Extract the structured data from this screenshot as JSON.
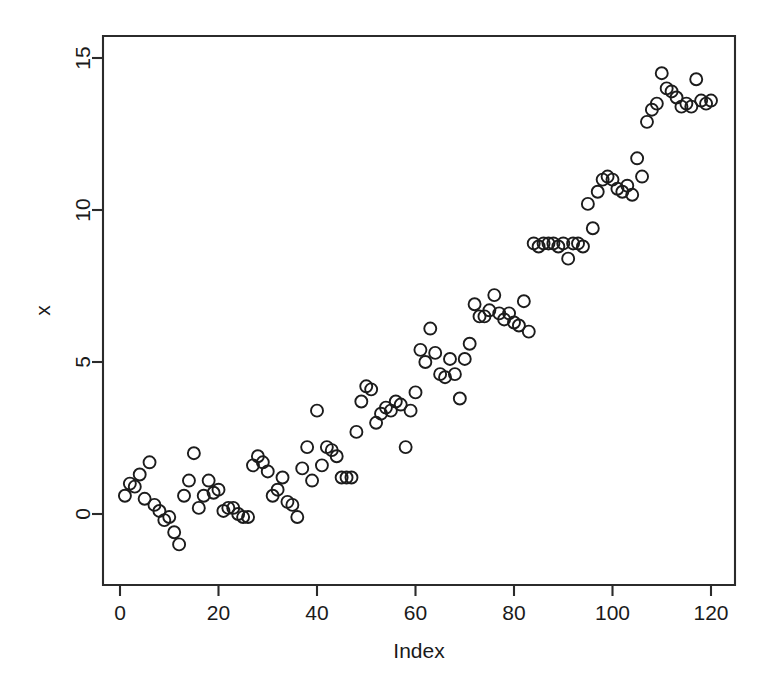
{
  "figure": {
    "background_color": "#ffffff",
    "foreground_color": "#1c1c1c",
    "width": 766,
    "height": 681
  },
  "axes": {
    "y_title": "x",
    "x_title": "Index",
    "x_ticks": [
      "0",
      "20",
      "40",
      "60",
      "80",
      "100",
      "120"
    ],
    "y_ticks": [
      "0",
      "5",
      "10",
      "15"
    ]
  },
  "chart_data": {
    "type": "scatter",
    "title": "",
    "xlabel": "Index",
    "ylabel": "x",
    "xlim": [
      -3,
      125
    ],
    "ylim": [
      -1.6,
      15.7
    ],
    "x_ticks": [
      0,
      20,
      40,
      60,
      80,
      100,
      120
    ],
    "y_ticks": [
      0,
      5,
      10,
      15
    ],
    "grid": false,
    "legend": null,
    "marker": "open-circle",
    "marker_size": 6,
    "n_points": 120,
    "x": [
      1,
      2,
      3,
      4,
      5,
      6,
      7,
      8,
      9,
      10,
      11,
      12,
      13,
      14,
      15,
      16,
      17,
      18,
      19,
      20,
      21,
      22,
      23,
      24,
      25,
      26,
      27,
      28,
      29,
      30,
      31,
      32,
      33,
      34,
      35,
      36,
      37,
      38,
      39,
      40,
      41,
      42,
      43,
      44,
      45,
      46,
      47,
      48,
      49,
      50,
      51,
      52,
      53,
      54,
      55,
      56,
      57,
      58,
      59,
      60,
      61,
      62,
      63,
      64,
      65,
      66,
      67,
      68,
      69,
      70,
      71,
      72,
      73,
      74,
      75,
      76,
      77,
      78,
      79,
      80,
      81,
      82,
      83,
      84,
      85,
      86,
      87,
      88,
      89,
      90,
      91,
      92,
      93,
      94,
      95,
      96,
      97,
      98,
      99,
      100,
      101,
      102,
      103,
      104,
      105,
      106,
      107,
      108,
      109,
      110,
      111,
      112,
      113,
      114,
      115,
      116,
      117,
      118,
      119,
      120
    ],
    "y": [
      0.6,
      1.0,
      0.9,
      1.3,
      0.5,
      1.7,
      0.3,
      0.1,
      -0.2,
      -0.1,
      -0.6,
      -1.0,
      0.6,
      1.1,
      2.0,
      0.2,
      0.6,
      1.1,
      0.7,
      0.8,
      0.1,
      0.2,
      0.2,
      0.0,
      -0.1,
      -0.1,
      1.6,
      1.9,
      1.7,
      1.4,
      0.6,
      0.8,
      1.2,
      0.4,
      0.3,
      -0.1,
      1.5,
      2.2,
      1.1,
      3.4,
      1.6,
      2.2,
      2.1,
      1.9,
      1.2,
      1.2,
      1.2,
      2.7,
      3.7,
      4.2,
      4.1,
      3.0,
      3.3,
      3.5,
      3.4,
      3.7,
      3.6,
      2.2,
      3.4,
      4.0,
      5.4,
      5.0,
      6.1,
      5.3,
      4.6,
      4.5,
      5.1,
      4.6,
      3.8,
      5.1,
      5.6,
      6.9,
      6.5,
      6.5,
      6.7,
      7.2,
      6.6,
      6.4,
      6.6,
      6.3,
      6.2,
      7.0,
      6.0,
      8.9,
      8.8,
      8.9,
      8.9,
      8.9,
      8.8,
      8.9,
      8.4,
      8.9,
      8.9,
      8.8,
      10.2,
      9.4,
      10.6,
      11.0,
      11.1,
      11.0,
      10.7,
      10.6,
      10.8,
      10.5,
      11.7,
      11.1,
      12.9,
      13.3,
      13.5,
      14.5,
      14.0,
      13.9,
      13.7,
      13.4,
      13.5,
      13.4,
      14.3,
      13.6,
      13.5,
      13.6,
      15.2,
      13.4
    ]
  }
}
